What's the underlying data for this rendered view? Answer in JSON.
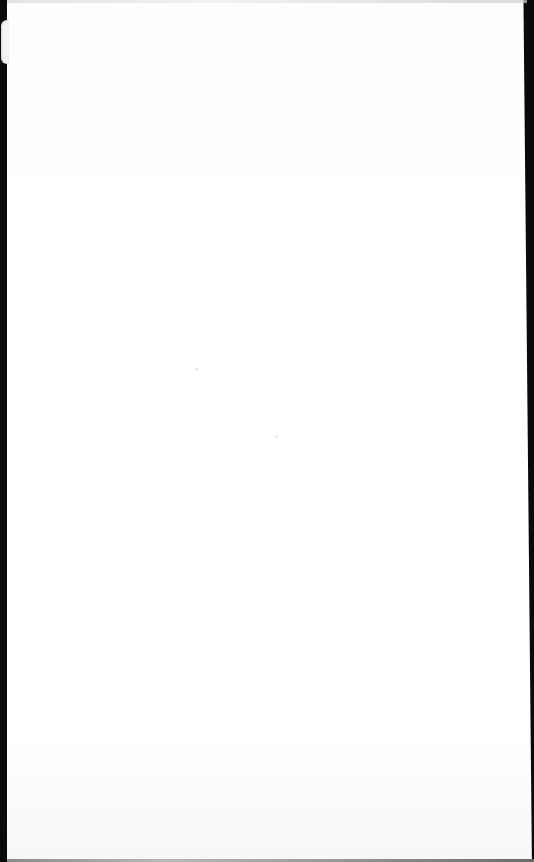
{
  "scene": {
    "description": "Blank white sheet of paper photographed against a dark background",
    "colors": {
      "background": "#0a0a0a",
      "paper": "#ffffff",
      "paper_edge": "#8a8a8a"
    }
  }
}
